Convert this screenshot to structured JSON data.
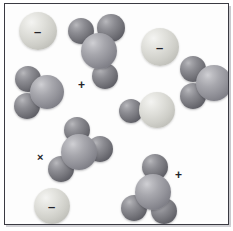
{
  "figure": {
    "background_color": "#ffffff",
    "frame_color": "#3a3a42",
    "palette": {
      "dark_sphere": "#76767c",
      "mid_sphere": "#929299",
      "light_sphere": "#dedeD9",
      "label_color": "#23232a"
    }
  },
  "labels": {
    "minus": "–",
    "plus": "+",
    "times": "×"
  },
  "species": [
    {
      "id": "ion-top-left",
      "kind": "single-sphere-ion",
      "charge": "–",
      "charge_position": "center",
      "atoms": [
        {
          "shade": "light",
          "cx": 33,
          "cy": 27,
          "r": 19
        }
      ]
    },
    {
      "id": "molecule-top-center",
      "kind": "four-sphere-molecule",
      "charge": "+",
      "charge_position": "below-left",
      "atoms": [
        {
          "shade": "dark",
          "cx": 76,
          "cy": 27,
          "r": 13
        },
        {
          "shade": "dark",
          "cx": 106,
          "cy": 24,
          "r": 14
        },
        {
          "shade": "mid",
          "cx": 94,
          "cy": 47,
          "r": 18
        },
        {
          "shade": "dark",
          "cx": 100,
          "cy": 72,
          "r": 13
        }
      ]
    },
    {
      "id": "ion-top-right",
      "kind": "single-sphere-ion",
      "charge": "–",
      "charge_position": "center",
      "atoms": [
        {
          "shade": "light",
          "cx": 155,
          "cy": 43,
          "r": 19
        }
      ]
    },
    {
      "id": "molecule-left",
      "kind": "three-sphere-water",
      "charge": null,
      "atoms": [
        {
          "shade": "dark",
          "cx": 23,
          "cy": 75,
          "r": 13
        },
        {
          "shade": "mid",
          "cx": 42,
          "cy": 88,
          "r": 17
        },
        {
          "shade": "dark",
          "cx": 22,
          "cy": 102,
          "r": 13
        }
      ]
    },
    {
      "id": "molecule-right-edge",
      "kind": "three-sphere-water",
      "charge": null,
      "atoms": [
        {
          "shade": "dark",
          "cx": 188,
          "cy": 65,
          "r": 13
        },
        {
          "shade": "mid",
          "cx": 209,
          "cy": 79,
          "r": 18
        },
        {
          "shade": "dark",
          "cx": 188,
          "cy": 92,
          "r": 13
        }
      ]
    },
    {
      "id": "molecule-center-pair",
      "kind": "two-sphere-molecule",
      "charge": null,
      "atoms": [
        {
          "shade": "dark",
          "cx": 126,
          "cy": 107,
          "r": 12
        },
        {
          "shade": "light",
          "cx": 152,
          "cy": 106,
          "r": 18
        }
      ]
    },
    {
      "id": "molecule-center-left",
      "kind": "four-sphere-molecule",
      "charge": "×",
      "charge_position": "left",
      "atoms": [
        {
          "shade": "dark",
          "cx": 72,
          "cy": 126,
          "r": 13
        },
        {
          "shade": "mid",
          "cx": 74,
          "cy": 148,
          "r": 18
        },
        {
          "shade": "dark",
          "cx": 95,
          "cy": 145,
          "r": 13
        },
        {
          "shade": "dark",
          "cx": 56,
          "cy": 165,
          "r": 13
        }
      ]
    },
    {
      "id": "molecule-bottom-right",
      "kind": "four-sphere-molecule",
      "charge": "+",
      "charge_position": "upper-right",
      "atoms": [
        {
          "shade": "dark",
          "cx": 150,
          "cy": 163,
          "r": 13
        },
        {
          "shade": "mid",
          "cx": 148,
          "cy": 188,
          "r": 18
        },
        {
          "shade": "dark",
          "cx": 129,
          "cy": 204,
          "r": 13
        },
        {
          "shade": "dark",
          "cx": 159,
          "cy": 207,
          "r": 13
        }
      ]
    },
    {
      "id": "ion-bottom-left",
      "kind": "single-sphere-ion",
      "charge": "–",
      "charge_position": "center",
      "atoms": [
        {
          "shade": "light",
          "cx": 47,
          "cy": 202,
          "r": 18
        }
      ]
    }
  ]
}
